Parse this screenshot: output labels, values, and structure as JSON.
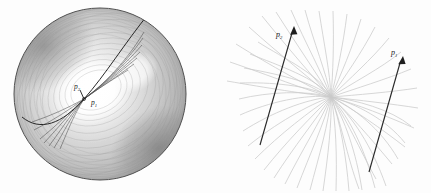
{
  "figure": {
    "type": "two-panel-mathematical-illustration",
    "background_color": "#fdfdfd",
    "panels": [
      {
        "id": "left",
        "name": "shaded-disk-panel",
        "description": "Shaded circular disk with concentric contour bands, a dark geodesic curve and a fan of geodesics emanating from an interior point",
        "disk": {
          "center_x": 100,
          "center_y": 94,
          "radius": 86,
          "boundary_color": "#4a4a4a",
          "bright_region_color": "#ffffff",
          "dark_region_color": "#6e6e6e"
        },
        "labels": [
          {
            "text": "p",
            "subscript": "2",
            "x": 76,
            "y": 88
          },
          {
            "text": "p",
            "subscript": "1",
            "x": 93,
            "y": 103
          }
        ],
        "vertex": {
          "x": 84,
          "y": 99
        }
      },
      {
        "id": "right",
        "name": "geodesic-fan-panel",
        "description": "Fan of light gray geodesic curves converging at a focal point with two dark labelled momentum arrows",
        "focus": {
          "x": 331,
          "y": 97
        },
        "curve_color": "#c9c9c9",
        "arrow_color": "#2a2a2a",
        "arrows": [
          {
            "name": "momentum-arrow-p2",
            "from_x": 260,
            "from_y": 145,
            "to_x": 294,
            "to_y": 29,
            "label": "p",
            "subscript": "2",
            "label_x": 279,
            "label_y": 34
          },
          {
            "name": "momentum-arrow-p1",
            "from_x": 369,
            "from_y": 172,
            "to_x": 403,
            "to_y": 59,
            "label": "p",
            "subscript": "1",
            "label_x": 395,
            "label_y": 52
          }
        ]
      }
    ]
  }
}
